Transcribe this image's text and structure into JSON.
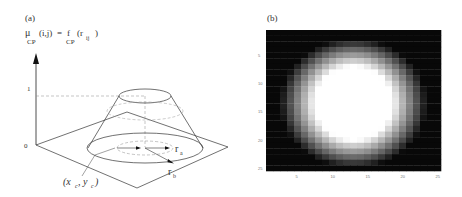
{
  "panel_a": {
    "label": "(a)",
    "formula": {
      "lhs_symbol": "μ",
      "lhs_sub": "CP",
      "lhs_args": "(i,j)",
      "equals": "=",
      "rhs_symbol": "f",
      "rhs_sub": "CP",
      "rhs_arg_open": "(r",
      "rhs_arg_sub": "ij",
      "rhs_arg_close": ")"
    },
    "axis_labels": {
      "one": "1",
      "zero": "0"
    },
    "center_label": "(x",
    "center_label_c1": "c",
    "center_label_mid": ", y",
    "center_label_c2": "c",
    "center_label_close": ")",
    "radius_a": {
      "symbol": "r",
      "sub": "a"
    },
    "radius_b": {
      "symbol": "r",
      "sub": "b"
    }
  },
  "panel_b": {
    "label": "(b)",
    "x_ticks": [
      "5",
      "10",
      "15",
      "20",
      "25"
    ],
    "y_ticks": [
      "5",
      "10",
      "15",
      "20",
      "25"
    ]
  },
  "chart_data": {
    "type": "heatmap",
    "title": "(b)",
    "grid_size": [
      25,
      25
    ],
    "center": [
      13,
      13.5
    ],
    "radius_a_cells": [
      5.5,
      6.5
    ],
    "radius_b_cells": [
      10.5,
      11.5
    ],
    "x_ticks": [
      5,
      10,
      15,
      20,
      25
    ],
    "y_ticks": [
      5,
      10,
      15,
      20,
      25
    ],
    "value_range": [
      0,
      1
    ],
    "colormap": "gray"
  }
}
